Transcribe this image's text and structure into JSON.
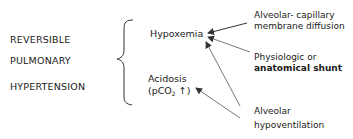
{
  "condition": {
    "lines": [
      "REVERSIBLE",
      "PULMONARY",
      "HYPERTENSION"
    ]
  },
  "effects": {
    "hypoxemia": "Hypoxemia",
    "acidosis": "Acidosis",
    "acidosis_detail_prefix": "(pCO",
    "acidosis_detail_sub": "2",
    "acidosis_detail_suffix": " ↑)"
  },
  "causes": {
    "diffusion": [
      "Alveolar- capillary",
      "membrane diffusion"
    ],
    "shunt": [
      "Physiologic or",
      "anatomical shunt"
    ],
    "hypoventilation": [
      "Alveolar",
      "hypoventilation"
    ]
  },
  "colors": {
    "text": "#1a1a1a",
    "lines": "#333333"
  }
}
